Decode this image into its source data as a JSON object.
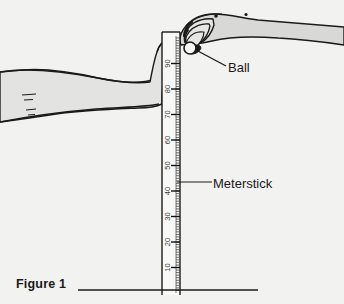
{
  "figure": {
    "caption": "Figure 1",
    "background_color": "#f2f2f0",
    "ink_color": "#1a1a1a",
    "skin_fill_color": "#d8d8d6"
  },
  "callouts": {
    "ball": {
      "label": "Ball",
      "leader_from": [
        196,
        50
      ],
      "leader_to": [
        226,
        66
      ]
    },
    "meterstick": {
      "label": "Meterstick",
      "leader_from": [
        177,
        182
      ],
      "leader_to": [
        212,
        182
      ]
    }
  },
  "meterstick": {
    "name": "meterstick",
    "top_y": 32,
    "bottom_y": 295,
    "left_x": 162,
    "right_x": 180,
    "tick_labels": [
      "90",
      "80",
      "70",
      "60",
      "50",
      "40",
      "30",
      "20",
      "10"
    ],
    "tick_label_values": [
      90,
      80,
      70,
      60,
      50,
      40,
      30,
      20,
      10
    ],
    "tick_label_rotation_deg": -90,
    "major_tick_interval_cm": 10,
    "minor_tick_interval_cm": 1,
    "scale_units": "cm"
  },
  "ball": {
    "name": "ball",
    "center": [
      190,
      48
    ],
    "radius": 6
  },
  "hands": {
    "dropping_hand": {
      "name": "right-hand-dropping-ball",
      "side": "right",
      "position": "top-right"
    },
    "catching_hand": {
      "name": "left-hand-catching",
      "side": "left",
      "position": "mid-left",
      "grip_reading_cm": 80
    }
  },
  "baseline": {
    "name": "caption-rule",
    "x1": 78,
    "x2": 258,
    "y": 290
  }
}
